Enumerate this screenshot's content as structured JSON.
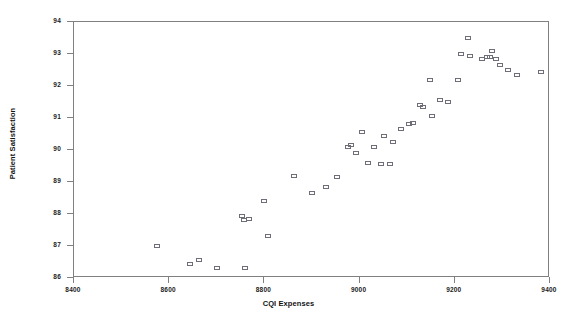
{
  "chart_data": {
    "type": "scatter",
    "title": "",
    "xlabel": "CQI Expenses",
    "ylabel": "Patient Satisfaction",
    "xlim": [
      8400,
      9400
    ],
    "ylim": [
      86,
      94
    ],
    "xticks": [
      8400,
      8600,
      8800,
      9000,
      9200,
      9400
    ],
    "yticks": [
      86,
      87,
      88,
      89,
      90,
      91,
      92,
      93,
      94
    ],
    "grid": false,
    "legend": null,
    "marker": "open-square",
    "marker_color": "#6e6e78",
    "points": [
      {
        "x": 8575,
        "y": 87.0
      },
      {
        "x": 8643,
        "y": 86.45
      },
      {
        "x": 8663,
        "y": 86.55
      },
      {
        "x": 8700,
        "y": 86.3
      },
      {
        "x": 8760,
        "y": 86.3
      },
      {
        "x": 8752,
        "y": 87.95
      },
      {
        "x": 8757,
        "y": 87.8
      },
      {
        "x": 8768,
        "y": 87.85
      },
      {
        "x": 8800,
        "y": 88.4
      },
      {
        "x": 8808,
        "y": 87.3
      },
      {
        "x": 8862,
        "y": 89.2
      },
      {
        "x": 8900,
        "y": 88.65
      },
      {
        "x": 8930,
        "y": 88.85
      },
      {
        "x": 8952,
        "y": 89.15
      },
      {
        "x": 8975,
        "y": 90.1
      },
      {
        "x": 8982,
        "y": 90.15
      },
      {
        "x": 8993,
        "y": 89.9
      },
      {
        "x": 9006,
        "y": 90.55
      },
      {
        "x": 9017,
        "y": 89.6
      },
      {
        "x": 9030,
        "y": 90.1
      },
      {
        "x": 9044,
        "y": 89.55
      },
      {
        "x": 9052,
        "y": 90.45
      },
      {
        "x": 9063,
        "y": 89.55
      },
      {
        "x": 9070,
        "y": 90.25
      },
      {
        "x": 9086,
        "y": 90.65
      },
      {
        "x": 9103,
        "y": 90.8
      },
      {
        "x": 9112,
        "y": 90.85
      },
      {
        "x": 9126,
        "y": 91.4
      },
      {
        "x": 9133,
        "y": 91.35
      },
      {
        "x": 9148,
        "y": 92.2
      },
      {
        "x": 9152,
        "y": 91.05
      },
      {
        "x": 9168,
        "y": 91.55
      },
      {
        "x": 9186,
        "y": 91.5
      },
      {
        "x": 9207,
        "y": 92.2
      },
      {
        "x": 9214,
        "y": 93.0
      },
      {
        "x": 9228,
        "y": 93.5
      },
      {
        "x": 9232,
        "y": 92.95
      },
      {
        "x": 9258,
        "y": 92.85
      },
      {
        "x": 9268,
        "y": 92.9
      },
      {
        "x": 9274,
        "y": 92.9
      },
      {
        "x": 9278,
        "y": 93.1
      },
      {
        "x": 9286,
        "y": 92.85
      },
      {
        "x": 9296,
        "y": 92.65
      },
      {
        "x": 9312,
        "y": 92.5
      },
      {
        "x": 9330,
        "y": 92.35
      },
      {
        "x": 9382,
        "y": 92.45
      }
    ]
  },
  "axes": {
    "x_title": "CQI Expenses",
    "y_title": "Patient Satisfaction",
    "x_tick_labels": [
      "8400",
      "8600",
      "8800",
      "9000",
      "9200",
      "9400"
    ],
    "y_tick_labels": [
      "86",
      "87",
      "88",
      "89",
      "90",
      "91",
      "92",
      "93",
      "94"
    ]
  }
}
